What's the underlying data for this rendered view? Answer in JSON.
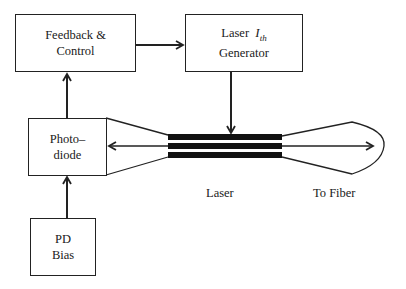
{
  "diagram": {
    "blocks": {
      "feedback_control": {
        "line1": "Feedback &",
        "line2": "Control"
      },
      "laser_generator": {
        "line1_prefix": "Laser",
        "symbol_main": "I",
        "symbol_sub": "th",
        "line2": "Generator"
      },
      "photodiode": {
        "line1": "Photo–",
        "line2": "diode"
      },
      "pd_bias": {
        "line1": "PD",
        "line2": "Bias"
      }
    },
    "labels": {
      "laser": "Laser",
      "to_fiber": "To Fiber"
    },
    "connections": [
      {
        "from": "PD Bias",
        "to": "Photodiode"
      },
      {
        "from": "Photodiode",
        "to": "Feedback & Control"
      },
      {
        "from": "Feedback & Control",
        "to": "Laser I_th Generator"
      },
      {
        "from": "Laser I_th Generator",
        "to": "Laser"
      },
      {
        "from": "Laser",
        "to": "Photodiode",
        "note": "back facet emission"
      },
      {
        "from": "Laser",
        "to": "To Fiber",
        "note": "front facet emission"
      }
    ],
    "colors": {
      "stroke": "#222222",
      "background": "#ffffff",
      "laser_bars": "#111111"
    }
  }
}
